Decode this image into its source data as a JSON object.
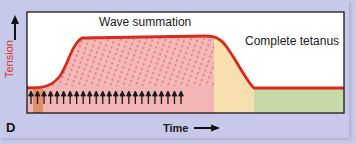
{
  "figure": {
    "panel_letter": "D",
    "title_left": "Wave summation",
    "title_right": "Complete tetanus",
    "y_axis_label": "Tension",
    "x_axis_label": "Time",
    "icons": {
      "y_arrow": "up-arrow-icon",
      "x_arrow": "right-arrow-icon",
      "stimulus": "stimulus-arrow-icon"
    },
    "stimulus_count": 24,
    "colors": {
      "background": "#c7c9ea",
      "plot_background": "#ffffff",
      "curve": "#d62a1e",
      "summation_fill": "#f1b5b5",
      "relaxation_fill": "#f7dfb0",
      "rest_fill": "#c7d9a6",
      "initial_twitch_fill": "#d98a5c",
      "axis_label": "#d9341f"
    },
    "regions": [
      {
        "name": "wave-summation-region",
        "x_start": 27,
        "x_end": 214,
        "color": "#f1b5b5"
      },
      {
        "name": "relaxation-region",
        "x_start": 214,
        "x_end": 254,
        "color": "#f7dfb0"
      },
      {
        "name": "rest-region",
        "x_start": 254,
        "x_end": 344,
        "color": "#c7d9a6"
      }
    ]
  }
}
